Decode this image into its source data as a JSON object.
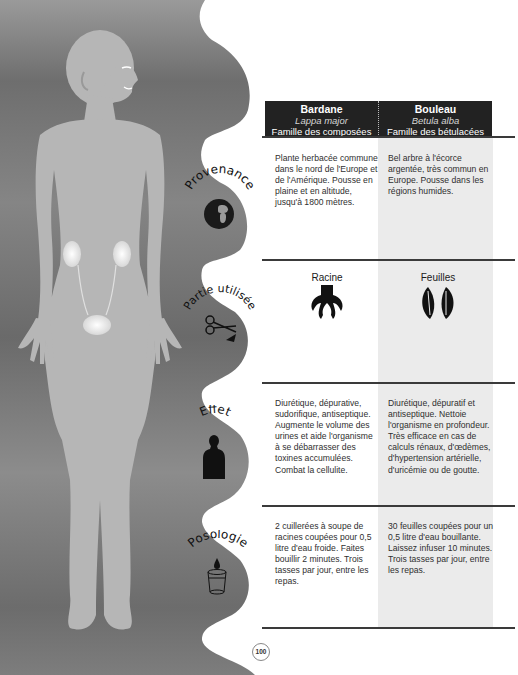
{
  "page_number": "100",
  "header": {
    "columns": [
      {
        "name": "Bardane",
        "latin": "Lappa major",
        "family": "Famille des composées"
      },
      {
        "name": "Bouleau",
        "latin": "Betula alba",
        "family": "Famille des bétulacées"
      }
    ]
  },
  "rows": [
    {
      "label": "Provenance",
      "icon": "globe-icon",
      "left": "Plante herbacée commune dans le nord de l'Europe et de l'Amérique. Pousse en plaine et en altitude, jusqu'à 1800 mètres.",
      "right": "Bel arbre à l'écorce argentée, très commun en Europe. Pousse dans les régions humides."
    },
    {
      "label": "Partie utilisée",
      "icon": "scissors-icon",
      "left_icon_label": "Racine",
      "left_icon": "root-icon",
      "right_icon_label": "Feuilles",
      "right_icon": "leaves-icon"
    },
    {
      "label": "Effet",
      "icon": "human-silhouette-icon",
      "left": "Diurétique, dépurative, sudorifique, antiseptique. Augmente le volume des urines et aide l'organisme à se débarrasser des toxines accumulées. Combat la cellulite.",
      "right": "Diurétique, dépuratif et antiseptique. Nettoie l'organisme en profondeur. Très efficace en cas de calculs rénaux, d'œdèmes, d'hypertension artérielle, d'uricémie ou de goutte."
    },
    {
      "label": "Posologie",
      "icon": "glass-drop-icon",
      "left": "2 cuillerées à soupe de racines coupées pour 0,5 litre d'eau froide. Faites bouillir 2 minutes. Trois tasses par jour, entre les repas.",
      "right": "30 feuilles coupées pour un 0,5 litre d'eau bouillante. Laissez infuser 10 minutes. Trois tasses par jour, entre les repas."
    }
  ],
  "colors": {
    "header_bg": "#222222",
    "right_column_bg": "#ebebeb",
    "panel_gray": "#7a7a7a",
    "body_gray": "#b4b4b4"
  }
}
